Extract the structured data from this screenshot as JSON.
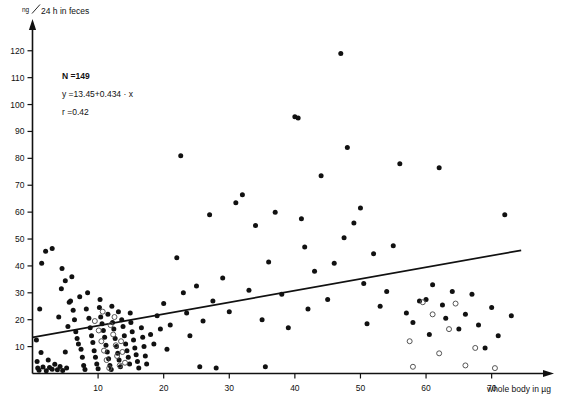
{
  "chart_data": {
    "type": "scatter",
    "title": "",
    "xlabel": "whole body in µg",
    "ylabel": "ng/24 h in feces",
    "ylabel_numerator": "ng",
    "ylabel_denominator": "24 h  in feces",
    "xlim": [
      0,
      76
    ],
    "ylim": [
      0,
      124
    ],
    "xticks": [
      10,
      20,
      30,
      40,
      50,
      60,
      70
    ],
    "yticks": [
      10,
      20,
      30,
      40,
      50,
      60,
      70,
      80,
      90,
      100,
      110,
      120
    ],
    "grid": false,
    "legend": "none",
    "annotations": {
      "n_label": "N =149",
      "equation": "y =13.45+0.434 · x",
      "correlation": "r =0.42"
    },
    "regression": {
      "intercept": 13.45,
      "slope": 0.434,
      "x_start": 0.0,
      "x_end": 74.5,
      "y_start": 13.45,
      "y_end": 45.8,
      "color": "#111111"
    },
    "series": [
      {
        "name": "filled",
        "marker": "filled-circle",
        "color": "#111111",
        "points": [
          [
            0.6,
            12.5
          ],
          [
            0.7,
            4.5
          ],
          [
            0.8,
            2.0
          ],
          [
            1.0,
            1.2
          ],
          [
            1.3,
            7.8
          ],
          [
            1.6,
            2.4
          ],
          [
            2.1,
            1.0
          ],
          [
            2.4,
            5.0
          ],
          [
            2.6,
            2.2
          ],
          [
            3.0,
            1.6
          ],
          [
            3.4,
            3.4
          ],
          [
            3.8,
            1.4
          ],
          [
            4.2,
            2.6
          ],
          [
            4.6,
            1.1
          ],
          [
            5.0,
            8.0
          ],
          [
            5.2,
            2.0
          ],
          [
            1.1,
            24.0
          ],
          [
            1.4,
            41.0
          ],
          [
            2.0,
            45.5
          ],
          [
            3.0,
            46.5
          ],
          [
            4.5,
            39.0
          ],
          [
            5.0,
            34.5
          ],
          [
            4.4,
            31.5
          ],
          [
            5.6,
            26.5
          ],
          [
            5.8,
            27.0
          ],
          [
            6.2,
            23.5
          ],
          [
            4.0,
            21.0
          ],
          [
            6.4,
            20.0
          ],
          [
            5.4,
            17.5
          ],
          [
            6.6,
            15.5
          ],
          [
            6.8,
            13.0
          ],
          [
            7.0,
            11.0
          ],
          [
            7.4,
            9.0
          ],
          [
            7.6,
            6.0
          ],
          [
            7.8,
            3.0
          ],
          [
            8.0,
            1.5
          ],
          [
            6.0,
            36.0
          ],
          [
            7.2,
            28.5
          ],
          [
            8.2,
            24.0
          ],
          [
            8.6,
            20.5
          ],
          [
            8.8,
            17.0
          ],
          [
            9.0,
            14.0
          ],
          [
            9.2,
            11.5
          ],
          [
            9.4,
            8.5
          ],
          [
            9.6,
            6.0
          ],
          [
            9.8,
            3.5
          ],
          [
            10.0,
            1.8
          ],
          [
            8.4,
            30.0
          ],
          [
            10.2,
            24.5
          ],
          [
            10.4,
            21.0
          ],
          [
            10.6,
            18.5
          ],
          [
            10.8,
            16.0
          ],
          [
            11.0,
            13.5
          ],
          [
            11.2,
            10.5
          ],
          [
            11.4,
            8.0
          ],
          [
            11.6,
            5.5
          ],
          [
            11.8,
            3.0
          ],
          [
            12.0,
            1.5
          ],
          [
            10.3,
            27.5
          ],
          [
            11.5,
            22.0
          ],
          [
            12.2,
            19.0
          ],
          [
            12.4,
            16.5
          ],
          [
            12.6,
            13.0
          ],
          [
            12.8,
            10.0
          ],
          [
            13.0,
            7.5
          ],
          [
            13.2,
            5.0
          ],
          [
            13.4,
            2.5
          ],
          [
            12.1,
            25.0
          ],
          [
            13.6,
            20.0
          ],
          [
            13.8,
            17.5
          ],
          [
            14.0,
            14.0
          ],
          [
            14.2,
            11.0
          ],
          [
            14.4,
            8.5
          ],
          [
            14.6,
            6.0
          ],
          [
            14.8,
            3.5
          ],
          [
            13.1,
            23.0
          ],
          [
            15.0,
            19.0
          ],
          [
            15.2,
            15.5
          ],
          [
            15.4,
            12.5
          ],
          [
            15.6,
            9.5
          ],
          [
            15.8,
            7.0
          ],
          [
            16.0,
            4.5
          ],
          [
            16.2,
            2.0
          ],
          [
            14.9,
            22.5
          ],
          [
            16.6,
            17.0
          ],
          [
            16.8,
            13.5
          ],
          [
            17.0,
            10.0
          ],
          [
            17.2,
            6.5
          ],
          [
            17.4,
            3.5
          ],
          [
            18.0,
            14.5
          ],
          [
            18.5,
            11.0
          ],
          [
            19.0,
            21.5
          ],
          [
            19.5,
            16.5
          ],
          [
            20.0,
            26.0
          ],
          [
            20.5,
            9.0
          ],
          [
            21.0,
            18.0
          ],
          [
            22.0,
            43.0
          ],
          [
            22.6,
            81.0
          ],
          [
            23.0,
            30.0
          ],
          [
            23.5,
            22.5
          ],
          [
            24.0,
            14.0
          ],
          [
            25.0,
            32.5
          ],
          [
            25.5,
            2.5
          ],
          [
            26.0,
            19.5
          ],
          [
            27.0,
            59.0
          ],
          [
            27.5,
            27.0
          ],
          [
            28.0,
            2.0
          ],
          [
            29.0,
            35.5
          ],
          [
            30.0,
            23.0
          ],
          [
            31.0,
            63.5
          ],
          [
            32.0,
            66.5
          ],
          [
            33.0,
            31.0
          ],
          [
            34.0,
            55.0
          ],
          [
            35.0,
            20.0
          ],
          [
            35.5,
            2.5
          ],
          [
            36.0,
            41.5
          ],
          [
            37.0,
            60.0
          ],
          [
            38.0,
            29.5
          ],
          [
            39.0,
            17.0
          ],
          [
            40.0,
            95.5
          ],
          [
            40.5,
            95.0
          ],
          [
            41.0,
            57.5
          ],
          [
            41.5,
            47.0
          ],
          [
            42.0,
            24.0
          ],
          [
            43.0,
            38.0
          ],
          [
            44.0,
            73.5
          ],
          [
            45.0,
            27.5
          ],
          [
            46.0,
            41.0
          ],
          [
            47.0,
            119.0
          ],
          [
            47.5,
            50.5
          ],
          [
            48.0,
            84.0
          ],
          [
            49.0,
            56.0
          ],
          [
            50.0,
            61.5
          ],
          [
            50.5,
            33.5
          ],
          [
            51.0,
            18.5
          ],
          [
            52.0,
            44.5
          ],
          [
            53.0,
            25.0
          ],
          [
            54.0,
            30.5
          ],
          [
            55.0,
            47.5
          ],
          [
            56.0,
            78.0
          ],
          [
            57.0,
            22.5
          ],
          [
            58.0,
            19.0
          ],
          [
            59.0,
            27.0
          ],
          [
            60.0,
            27.5
          ],
          [
            60.5,
            14.5
          ],
          [
            61.0,
            33.0
          ],
          [
            62.0,
            76.5
          ],
          [
            62.5,
            25.5
          ],
          [
            63.0,
            20.5
          ],
          [
            64.0,
            30.5
          ],
          [
            65.0,
            16.5
          ],
          [
            66.0,
            22.0
          ],
          [
            67.0,
            29.5
          ],
          [
            68.0,
            18.0
          ],
          [
            69.0,
            9.5
          ],
          [
            70.0,
            24.5
          ],
          [
            71.0,
            14.0
          ],
          [
            72.0,
            59.0
          ],
          [
            73.0,
            21.5
          ]
        ]
      },
      {
        "name": "open",
        "marker": "open-circle",
        "color": "#555555",
        "points": [
          [
            9.5,
            19.5
          ],
          [
            10.1,
            16.0
          ],
          [
            10.5,
            12.0
          ],
          [
            10.9,
            8.5
          ],
          [
            11.3,
            5.0
          ],
          [
            11.7,
            2.0
          ],
          [
            12.3,
            14.5
          ],
          [
            12.7,
            10.5
          ],
          [
            12.9,
            6.5
          ],
          [
            13.3,
            3.0
          ],
          [
            11.9,
            18.0
          ],
          [
            13.5,
            12.0
          ],
          [
            12.5,
            21.0
          ],
          [
            13.7,
            8.0
          ],
          [
            10.7,
            23.0
          ],
          [
            14.1,
            4.0
          ],
          [
            57.5,
            12.0
          ],
          [
            58.0,
            2.5
          ],
          [
            59.5,
            26.5
          ],
          [
            61.0,
            22.0
          ],
          [
            62.0,
            7.5
          ],
          [
            63.5,
            16.5
          ],
          [
            64.5,
            26.0
          ],
          [
            66.0,
            3.0
          ],
          [
            67.5,
            9.5
          ],
          [
            70.5,
            2.0
          ]
        ]
      }
    ]
  },
  "axes": {
    "y_axis_name": "y-axis",
    "x_axis_name": "x-axis"
  }
}
